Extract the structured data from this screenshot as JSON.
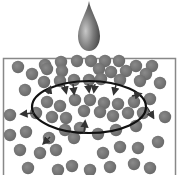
{
  "diagram": {
    "colors": {
      "particle": "#777777",
      "drop": "#666666",
      "border": "#888888",
      "ellipse": "#111111",
      "arrow": "#333333"
    },
    "ellipse": {
      "cx": 89,
      "cy": 107,
      "rx": 57,
      "ry": 26
    },
    "particles": [
      [
        45,
        65
      ],
      [
        61,
        62
      ],
      [
        77,
        61
      ],
      [
        91,
        61
      ],
      [
        105,
        61
      ],
      [
        119,
        61
      ],
      [
        136,
        66
      ],
      [
        152,
        66
      ],
      [
        18,
        67
      ],
      [
        32,
        74
      ],
      [
        47,
        69
      ],
      [
        62,
        71
      ],
      [
        99,
        69
      ],
      [
        111,
        72
      ],
      [
        126,
        71
      ],
      [
        146,
        74
      ],
      [
        25,
        90
      ],
      [
        44,
        82
      ],
      [
        60,
        81
      ],
      [
        74,
        80
      ],
      [
        89,
        80
      ],
      [
        101,
        79
      ],
      [
        120,
        80
      ],
      [
        140,
        81
      ],
      [
        160,
        83
      ],
      [
        47,
        102
      ],
      [
        60,
        106
      ],
      [
        75,
        100
      ],
      [
        90,
        100
      ],
      [
        104,
        103
      ],
      [
        118,
        104
      ],
      [
        134,
        102
      ],
      [
        150,
        99
      ],
      [
        36,
        113
      ],
      [
        52,
        117
      ],
      [
        66,
        118
      ],
      [
        84,
        111
      ],
      [
        100,
        112
      ],
      [
        113,
        116
      ],
      [
        128,
        113
      ],
      [
        143,
        113
      ],
      [
        10,
        115
      ],
      [
        10,
        135
      ],
      [
        26,
        132
      ],
      [
        49,
        138
      ],
      [
        65,
        130
      ],
      [
        80,
        128
      ],
      [
        98,
        134
      ],
      [
        116,
        130
      ],
      [
        136,
        126
      ],
      [
        165,
        117
      ],
      [
        20,
        150
      ],
      [
        40,
        153
      ],
      [
        56,
        150
      ],
      [
        74,
        138
      ],
      [
        103,
        153
      ],
      [
        120,
        147
      ],
      [
        138,
        148
      ],
      [
        158,
        142
      ],
      [
        28,
        168
      ],
      [
        58,
        170
      ],
      [
        72,
        166
      ],
      [
        90,
        170
      ],
      [
        110,
        167
      ],
      [
        134,
        164
      ],
      [
        150,
        168
      ]
    ],
    "arrows": [
      {
        "x1": 48,
        "y1": 94,
        "x2": 50,
        "y2": 88,
        "dir": "in"
      },
      {
        "x1": 64,
        "y1": 84,
        "x2": 66,
        "y2": 92,
        "dir": "in"
      },
      {
        "x1": 73,
        "y1": 84,
        "x2": 74,
        "y2": 93,
        "dir": "in"
      },
      {
        "x1": 88,
        "y1": 84,
        "x2": 89,
        "y2": 91,
        "dir": "in"
      },
      {
        "x1": 95,
        "y1": 84,
        "x2": 94,
        "y2": 91,
        "dir": "in"
      },
      {
        "x1": 116,
        "y1": 85,
        "x2": 114,
        "y2": 93,
        "dir": "in"
      },
      {
        "x1": 132,
        "y1": 96,
        "x2": 140,
        "y2": 94,
        "dir": "out"
      },
      {
        "x1": 147,
        "y1": 107,
        "x2": 153,
        "y2": 117,
        "dir": "out"
      },
      {
        "x1": 34,
        "y1": 113,
        "x2": 22,
        "y2": 114,
        "dir": "out"
      },
      {
        "x1": 50,
        "y1": 137,
        "x2": 44,
        "y2": 143,
        "dir": "out"
      },
      {
        "x1": 84,
        "y1": 133,
        "x2": 85,
        "y2": 122,
        "dir": "out"
      }
    ]
  }
}
